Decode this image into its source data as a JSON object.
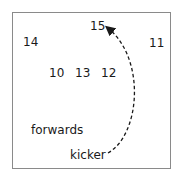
{
  "diagram": {
    "players": [
      {
        "number": "15",
        "x": 90,
        "y": 20
      },
      {
        "number": "14",
        "x": 23,
        "y": 36
      },
      {
        "number": "11",
        "x": 149,
        "y": 37
      },
      {
        "number": "10",
        "x": 49,
        "y": 67
      },
      {
        "number": "13",
        "x": 75,
        "y": 67
      },
      {
        "number": "12",
        "x": 101,
        "y": 67
      }
    ],
    "labels": {
      "forwards": "forwards",
      "kicker": "kicker"
    },
    "arrow": {
      "style": "dashed",
      "from": "kicker",
      "to": "15",
      "color": "#1a1a1a"
    }
  }
}
